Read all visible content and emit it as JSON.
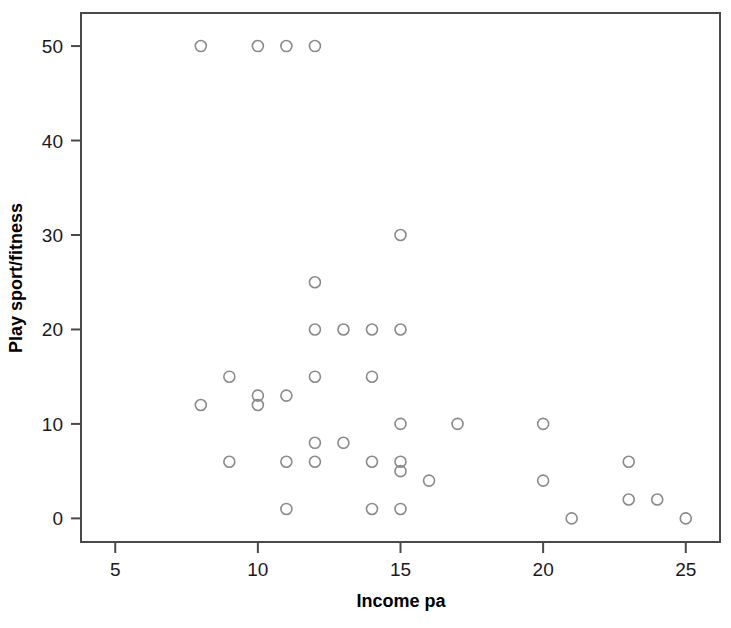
{
  "chart_data": {
    "type": "scatter",
    "title": "",
    "xlabel": "Income pa",
    "ylabel": "Play sport/fitness",
    "xlim": [
      3.8,
      26.2
    ],
    "ylim": [
      -2.5,
      53.5
    ],
    "xticks": [
      5,
      10,
      15,
      20,
      25
    ],
    "yticks": [
      0,
      10,
      20,
      30,
      40,
      50
    ],
    "xtick_labels": [
      "5",
      "10",
      "15",
      "20",
      "25"
    ],
    "ytick_labels": [
      "0",
      "10",
      "20",
      "30",
      "40",
      "50"
    ],
    "grid": false,
    "legend": false,
    "marker": {
      "shape": "open-circle",
      "radius": 5.5,
      "stroke_color": "#8a8a8a",
      "fill": "none"
    },
    "frame_color": "#4a4a4a",
    "n_points": 41,
    "points": [
      {
        "x": 8,
        "y": 50
      },
      {
        "x": 10,
        "y": 50
      },
      {
        "x": 11,
        "y": 50
      },
      {
        "x": 12,
        "y": 50
      },
      {
        "x": 15,
        "y": 30
      },
      {
        "x": 12,
        "y": 25
      },
      {
        "x": 12,
        "y": 20
      },
      {
        "x": 13,
        "y": 20
      },
      {
        "x": 14,
        "y": 20
      },
      {
        "x": 15,
        "y": 20
      },
      {
        "x": 9,
        "y": 15
      },
      {
        "x": 12,
        "y": 15
      },
      {
        "x": 14,
        "y": 15
      },
      {
        "x": 10,
        "y": 13
      },
      {
        "x": 11,
        "y": 13
      },
      {
        "x": 10,
        "y": 12
      },
      {
        "x": 8,
        "y": 12
      },
      {
        "x": 15,
        "y": 10
      },
      {
        "x": 17,
        "y": 10
      },
      {
        "x": 20,
        "y": 10
      },
      {
        "x": 12,
        "y": 8
      },
      {
        "x": 13,
        "y": 8
      },
      {
        "x": 9,
        "y": 6
      },
      {
        "x": 11,
        "y": 6
      },
      {
        "x": 12,
        "y": 6
      },
      {
        "x": 14,
        "y": 6
      },
      {
        "x": 15,
        "y": 6
      },
      {
        "x": 23,
        "y": 6
      },
      {
        "x": 15,
        "y": 5
      },
      {
        "x": 16,
        "y": 4
      },
      {
        "x": 20,
        "y": 4
      },
      {
        "x": 23,
        "y": 2
      },
      {
        "x": 24,
        "y": 2
      },
      {
        "x": 11,
        "y": 1
      },
      {
        "x": 14,
        "y": 1
      },
      {
        "x": 15,
        "y": 1
      },
      {
        "x": 21,
        "y": 0
      },
      {
        "x": 25,
        "y": 0
      }
    ]
  }
}
